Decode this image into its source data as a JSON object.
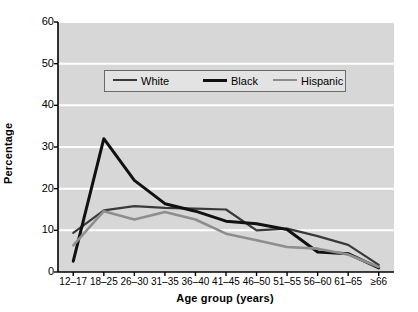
{
  "chart_data": {
    "type": "line",
    "title": "",
    "xlabel": "Age group (years)",
    "ylabel": "Percentage",
    "categories": [
      "12–17",
      "18–25",
      "26–30",
      "31–35",
      "36–40",
      "41–45",
      "46–50",
      "51–55",
      "56–60",
      "61–65",
      "≥66"
    ],
    "ylim": [
      0,
      60
    ],
    "yticks": [
      0,
      10,
      20,
      30,
      40,
      50,
      60
    ],
    "grid": "horizontal-white",
    "legend_position": "upper-center",
    "plot_background": "#d7d7d7",
    "gridline_color": "#ffffff",
    "series": [
      {
        "name": "White",
        "color": "#3a3a3a",
        "width": 2.2,
        "values": [
          9.4,
          14.8,
          15.8,
          15.4,
          15.2,
          15.0,
          10.0,
          10.4,
          8.6,
          6.5,
          1.7
        ]
      },
      {
        "name": "Black",
        "color": "#111111",
        "width": 3.0,
        "values": [
          2.6,
          32.0,
          22.0,
          16.4,
          14.6,
          12.2,
          11.6,
          10.2,
          4.8,
          4.4,
          1.0
        ]
      },
      {
        "name": "Hispanic",
        "color": "#8e8e8e",
        "width": 2.6,
        "values": [
          6.4,
          14.6,
          12.6,
          14.4,
          12.6,
          9.2,
          7.6,
          6.0,
          5.6,
          4.2,
          1.2
        ]
      }
    ]
  },
  "legend": {
    "entries": [
      {
        "label": "White"
      },
      {
        "label": "Black"
      },
      {
        "label": "Hispanic"
      }
    ]
  },
  "axes": {
    "y_title": "Percentage",
    "x_title": "Age group (years)",
    "y_tick_labels": [
      "60",
      "50",
      "40",
      "30",
      "20",
      "10",
      "0"
    ],
    "x_tick_labels": [
      "12–17",
      "18–25",
      "26–30",
      "31–35",
      "36–40",
      "41–45",
      "46–50",
      "51–55",
      "56–60",
      "61–65",
      "≥66"
    ]
  }
}
